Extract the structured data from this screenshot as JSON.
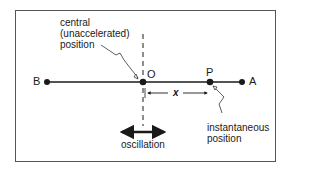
{
  "diagram": {
    "points": {
      "B": "B",
      "O": "O",
      "P": "P",
      "A": "A"
    },
    "labels": {
      "central_line1": "central",
      "central_line2": "(unaccelerated)",
      "central_line3": "position",
      "instant_line1": "instantaneous",
      "instant_line2": "position",
      "displacement": "x",
      "oscillation": "oscillation"
    },
    "colors": {
      "ink": "#1a1a1a",
      "frame": "#555555",
      "background": "#ffffff"
    }
  }
}
